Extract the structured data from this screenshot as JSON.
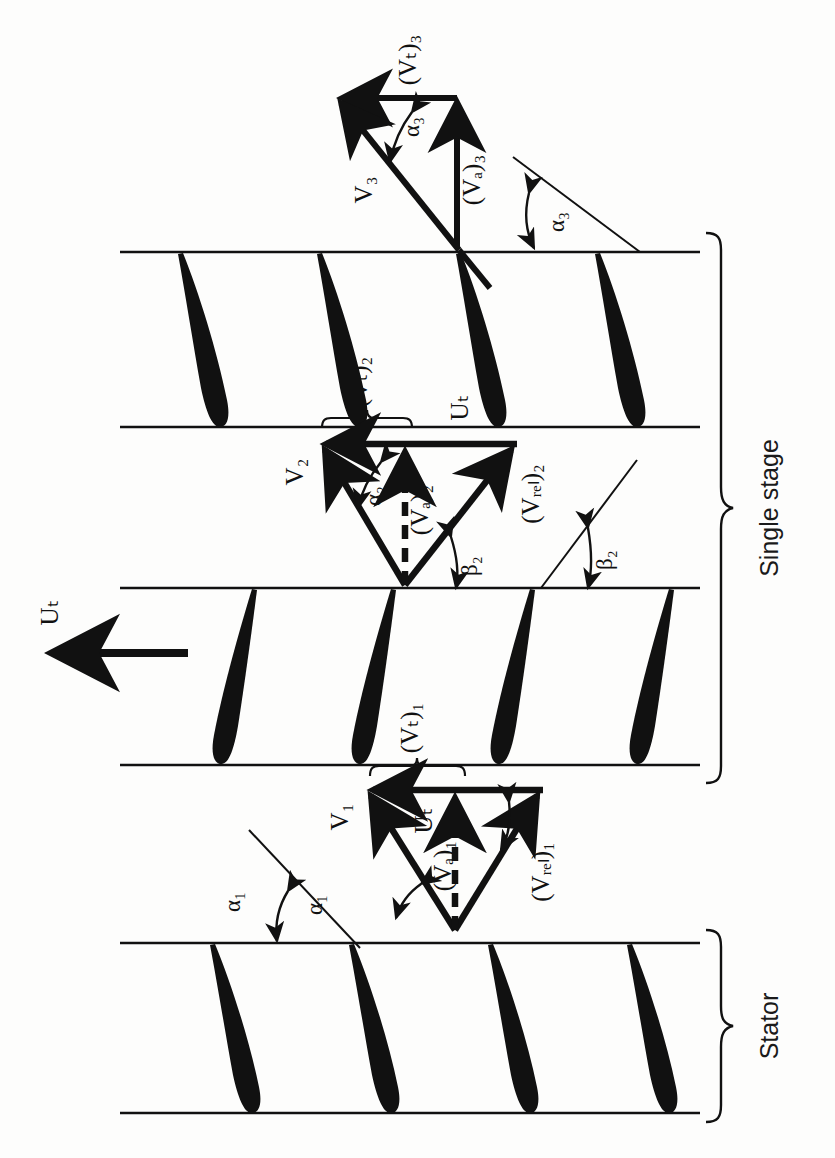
{
  "figure": {
    "kind": "axial-compressor-stage-velocity-triangles",
    "background": "#fdfdfc",
    "ink": "#111111",
    "orientation_note": "diagram drawn rotated 90 degrees; all labels read bottom-to-top"
  },
  "brackets": [
    {
      "name": "single-stage",
      "label": "Single stage",
      "top": 233,
      "bottom": 783
    },
    {
      "name": "stator",
      "label": "Stator",
      "top": 930,
      "bottom": 1122
    }
  ],
  "blade_rows": [
    {
      "name": "rotor-upper",
      "role": "Rotor",
      "top": 252,
      "bottom": 427,
      "count": 4,
      "curve": "leading-edge-left"
    },
    {
      "name": "rotor-lower",
      "role": "Rotor",
      "top": 588,
      "bottom": 765,
      "count": 4,
      "curve": "leading-edge-right"
    },
    {
      "name": "stator-row",
      "role": "Stator",
      "top": 943,
      "bottom": 1113,
      "count": 4,
      "curve": "leading-edge-left"
    }
  ],
  "wheel_speed": {
    "name": "blade-speed-arrow",
    "label": "Uₜ",
    "direction": "left",
    "x_tail": 188,
    "x_head": 45,
    "y": 653
  },
  "triangles": [
    {
      "name": "station-3-exit-triangle",
      "station": 3,
      "apex": {
        "x": 457,
        "y": 248
      },
      "top_right": {
        "x": 457,
        "y": 98
      },
      "top_left": {
        "x": 336,
        "y": 98
      },
      "vectors": [
        {
          "name": "absolute-velocity-V3",
          "label": "V₃",
          "style": "solid"
        },
        {
          "name": "axial-velocity-Va3",
          "label": "(Vₐ)₃",
          "style": "solid"
        },
        {
          "name": "tangential-velocity-Vt3",
          "label": "(Vₜ)₃",
          "style": "solid"
        }
      ],
      "angles": [
        {
          "name": "alpha-3-triangle",
          "label": "α₃"
        },
        {
          "name": "alpha-3-blade",
          "label": "α₃"
        }
      ]
    },
    {
      "name": "station-2-rotor-exit-triangle",
      "station": 2,
      "apex": {
        "x": 405,
        "y": 585
      },
      "top_left": {
        "x": 320,
        "y": 444
      },
      "top_right": {
        "x": 515,
        "y": 444
      },
      "vectors": [
        {
          "name": "absolute-velocity-V2",
          "label": "V₂",
          "style": "solid"
        },
        {
          "name": "relative-velocity-Vrel2",
          "label": "(Vᵣₑₗ)₂",
          "style": "solid"
        },
        {
          "name": "axial-velocity-Va2",
          "label": "(Vₐ)₂",
          "style": "dashed"
        },
        {
          "name": "blade-speed-Ut-2",
          "label": "Uₜ",
          "style": "solid"
        }
      ],
      "angles": [
        {
          "name": "alpha-2-triangle",
          "label": "α₂"
        },
        {
          "name": "beta-2-triangle",
          "label": "β₂"
        },
        {
          "name": "beta-2-blade",
          "label": "β₂"
        }
      ],
      "brace": {
        "name": "vt2-brace",
        "label": "(Vₜ)₂",
        "x_from": 322,
        "x_to": 412,
        "y": 420
      }
    },
    {
      "name": "station-1-rotor-inlet-triangle",
      "station": 1,
      "apex": {
        "x": 455,
        "y": 930
      },
      "top_left": {
        "x": 367,
        "y": 790
      },
      "top_right": {
        "x": 540,
        "y": 790
      },
      "vectors": [
        {
          "name": "absolute-velocity-V1",
          "label": "V₁",
          "style": "solid"
        },
        {
          "name": "relative-velocity-Vrel1",
          "label": "(Vᵣₑₗ)₁",
          "style": "solid"
        },
        {
          "name": "axial-velocity-Va1",
          "label": "(Vₐ)₁",
          "style": "dashed"
        },
        {
          "name": "blade-speed-Ut-1",
          "label": "Uₜ",
          "style": "solid"
        }
      ],
      "angles": [
        {
          "name": "alpha-1-triangle",
          "label": "α₁"
        },
        {
          "name": "beta-1-triangle",
          "label": "β₁"
        },
        {
          "name": "alpha-1-blade",
          "label": "α₁"
        }
      ],
      "brace": {
        "name": "vt1-brace",
        "label": "(Vₜ)₁",
        "x_from": 370,
        "x_to": 465,
        "y": 768
      }
    }
  ],
  "labels": {
    "Vt3": "(Vₜ)₃",
    "Va3": "(Vₐ)₃",
    "V3": "V₃",
    "alpha3_tri": "α₃",
    "alpha3_blade": "α₃",
    "Vt2": "(Vₜ)₂",
    "Ut_mid": "Uₜ",
    "V2": "V₂",
    "alpha2": "α₂",
    "Va2": "(Vₐ)₂",
    "Vrel2": "(Vᵣₑₗ)₂",
    "beta2_tri": "β₂",
    "beta2_blade": "β₂",
    "Ut_main": "Uₜ",
    "Vt1": "(Vₜ)₁",
    "V1": "V₁",
    "Ut_bot": "Uₜ",
    "beta1": "β₁",
    "Va1": "(Vₐ)₁",
    "Vrel1": "(Vᵣₑₗ)₁",
    "alpha1_tri": "α₁",
    "alpha1_blade": "α₁",
    "single_stage": "Single stage",
    "stator": "Stator"
  }
}
